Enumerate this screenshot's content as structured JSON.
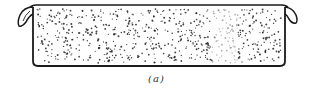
{
  "figure": {
    "caption": "(a)",
    "stroke_color": "#1a1a1a",
    "dot_color": "#222222",
    "background": "#ffffff"
  }
}
